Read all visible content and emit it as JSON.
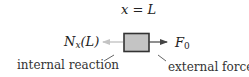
{
  "diagram": {
    "position_label": {
      "var": "x",
      "op": "=",
      "value": "L"
    },
    "left_force_label": {
      "symbol": "N",
      "subscript": "x",
      "arg": "(L)"
    },
    "right_force_label": {
      "symbol": "F",
      "subscript": "0"
    },
    "annotations": {
      "left": "internal reaction",
      "right": "external force"
    },
    "colors": {
      "box_fill": "#c4c4c4",
      "box_stroke": "#333333",
      "external_arrow": "#444444",
      "internal_arrow": "#bbbbbb",
      "leader_line": "#555555",
      "text": "#222222"
    }
  }
}
